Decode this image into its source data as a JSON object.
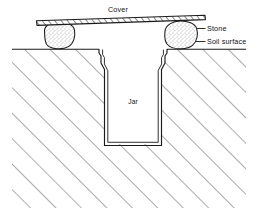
{
  "figure": {
    "type": "cross-section-diagram",
    "background_color": "#ffffff",
    "ink_color": "#1a1a1a",
    "labels": {
      "cover": "Cover",
      "stone": "Stone",
      "soil_surface": "Soil surface",
      "jar": "Jar"
    },
    "parts": [
      {
        "name": "cover",
        "label": "Cover",
        "description": "thin flat board drawn with hatched edge, tilted slightly, resting on two stones above the jar mouth",
        "fill": "#ffffff"
      },
      {
        "name": "stone-left",
        "label": "Stone",
        "description": "rounded stippled stone supporting the left side of the cover",
        "fill": "#fefefe"
      },
      {
        "name": "stone-right",
        "label": "Stone",
        "description": "angular stippled stone supporting the right side of the cover",
        "fill": "#fefefe"
      },
      {
        "name": "soil",
        "label": "Soil surface",
        "description": "ground mass shown with 45 degree diagonal hatching below the soil surface line",
        "hatch_angle_degrees": 45,
        "hatch_spacing_px": 18,
        "fill": "#ffffff"
      },
      {
        "name": "jar",
        "label": "Jar",
        "description": "glass jar buried with rim flush to soil surface, flared lip, tapered shoulder, straight body and flat base, drawn with double wall lines",
        "fill": "#ffffff"
      }
    ]
  }
}
